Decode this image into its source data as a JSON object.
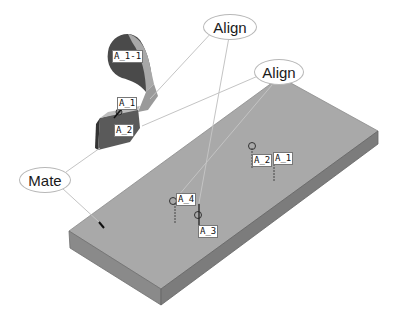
{
  "diagram": {
    "type": "cad-assembly-constraints",
    "colors": {
      "background": "#ffffff",
      "plate_top": "#a9a9a9",
      "plate_front": "#8a8a8a",
      "plate_side": "#7a7a7a",
      "bracket_dark": "#4a4a4a",
      "bracket_light": "#b0b0b0",
      "leader_line": "#c0c0c0",
      "callout_border": "#b8b8b8"
    },
    "callouts": [
      {
        "id": "align-1",
        "label": "Align"
      },
      {
        "id": "align-2",
        "label": "Align"
      },
      {
        "id": "mate",
        "label": "Mate"
      }
    ],
    "bracket_tags": [
      {
        "label": "A_1-1"
      },
      {
        "label": "A_1"
      },
      {
        "label": "A_2"
      }
    ],
    "plate_tags": [
      {
        "label": "A_2"
      },
      {
        "label": "A_1"
      },
      {
        "label": "A_4"
      },
      {
        "label": "A_3"
      }
    ]
  }
}
